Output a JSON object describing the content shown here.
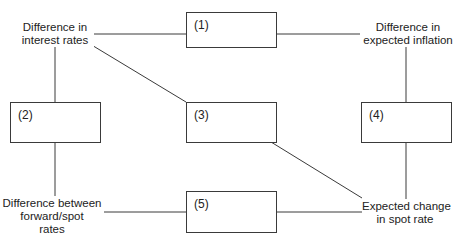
{
  "diagram": {
    "type": "parity-relationships",
    "nodes": {
      "interest_rates": {
        "lines": [
          "Difference in",
          "interest rates"
        ]
      },
      "expected_inflation": {
        "lines": [
          "Difference in",
          "expected inflation"
        ]
      },
      "forward_spot": {
        "lines": [
          "Difference between",
          "forward/spot",
          "rates"
        ]
      },
      "spot_change": {
        "lines": [
          "Expected change",
          "in spot rate"
        ]
      }
    },
    "boxes": [
      {
        "id": "box-1",
        "label": "(1)"
      },
      {
        "id": "box-2",
        "label": "(2)"
      },
      {
        "id": "box-3",
        "label": "(3)"
      },
      {
        "id": "box-4",
        "label": "(4)"
      },
      {
        "id": "box-5",
        "label": "(5)"
      }
    ],
    "edges": [
      {
        "from": "Difference in interest rates",
        "via": "(1)",
        "to": "Difference in expected inflation"
      },
      {
        "from": "Difference in interest rates",
        "via": "(2)",
        "to": "Difference between forward/spot rates"
      },
      {
        "from": "Difference in interest rates",
        "via": "(3)",
        "to": "Expected change in spot rate"
      },
      {
        "from": "Difference in expected inflation",
        "via": "(4)",
        "to": "Expected change in spot rate"
      },
      {
        "from": "Difference between forward/spot rates",
        "via": "(5)",
        "to": "Expected change in spot rate"
      }
    ],
    "colors": {
      "line": "#3a3a3a",
      "text": "#222222",
      "background": "#ffffff"
    }
  }
}
